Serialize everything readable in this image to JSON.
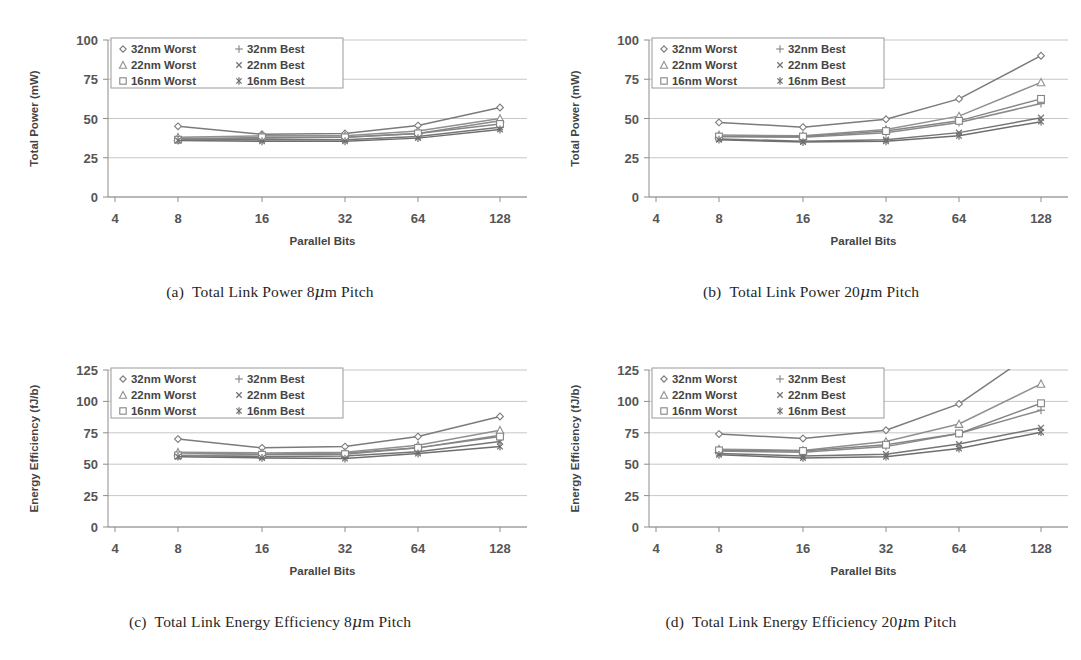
{
  "figure": {
    "panels": [
      "a",
      "b",
      "c",
      "d"
    ]
  },
  "captions": {
    "a": {
      "tag": "(a)",
      "text_before": "Total Link Power 8",
      "mu": "μ",
      "text_after": "m Pitch"
    },
    "b": {
      "tag": "(b)",
      "text_before": "Total Link Power 20",
      "mu": "μ",
      "text_after": "m Pitch"
    },
    "c": {
      "tag": "(c)",
      "text_before": "Total Link Energy Efficiency 8",
      "mu": "μ",
      "text_after": "m Pitch"
    },
    "d": {
      "tag": "(d)",
      "text_before": "Total Link Energy Efficiency 20",
      "mu": "μ",
      "text_after": "m Pitch"
    }
  },
  "legend": {
    "entries": [
      {
        "label": "32nm Worst",
        "marker": "diamond",
        "color": "#7b7b7b"
      },
      {
        "label": "32nm Best",
        "marker": "plus",
        "color": "#8a8a8a"
      },
      {
        "label": "22nm Worst",
        "marker": "triangle",
        "color": "#909090"
      },
      {
        "label": "22nm Best",
        "marker": "cross",
        "color": "#757575"
      },
      {
        "label": "16nm Worst",
        "marker": "square",
        "color": "#858585"
      },
      {
        "label": "16nm Best",
        "marker": "asterisk",
        "color": "#6e6e6e"
      }
    ],
    "order_display": [
      "32nm Worst",
      "32nm Best",
      "22nm Worst",
      "22nm Best",
      "16nm Worst",
      "16nm Best"
    ]
  },
  "chart_data": [
    {
      "id": "a",
      "type": "line",
      "title": "Total Link Power 8μm Pitch",
      "xlabel": "Parallel Bits",
      "ylabel": "Total Power (mW)",
      "categories": [
        "4",
        "8",
        "16",
        "32",
        "64",
        "128"
      ],
      "x": [
        4,
        8,
        16,
        32,
        64,
        128
      ],
      "xticklabels": [
        "4",
        "8",
        "16",
        "32",
        "64",
        "128"
      ],
      "yticklabels": [
        "0",
        "25",
        "50",
        "75",
        "100"
      ],
      "yticks": [
        0,
        25,
        50,
        75,
        100
      ],
      "ylim": [
        0,
        100
      ],
      "grid": true,
      "legend_position": "top-left",
      "series": [
        {
          "name": "32nm Worst",
          "marker": "diamond",
          "values": [
            null,
            45.0,
            40.0,
            40.5,
            45.5,
            57.0
          ]
        },
        {
          "name": "32nm Best",
          "marker": "plus",
          "values": [
            null,
            37.5,
            37.5,
            38.0,
            40.5,
            48.5
          ]
        },
        {
          "name": "22nm Worst",
          "marker": "triangle",
          "values": [
            null,
            38.0,
            39.0,
            39.0,
            42.0,
            50.0
          ]
        },
        {
          "name": "22nm Best",
          "marker": "cross",
          "values": [
            null,
            36.5,
            36.5,
            36.5,
            38.5,
            44.5
          ]
        },
        {
          "name": "16nm Worst",
          "marker": "square",
          "values": [
            null,
            36.5,
            38.0,
            38.0,
            40.5,
            46.5
          ]
        },
        {
          "name": "16nm Best",
          "marker": "asterisk",
          "values": [
            null,
            36.0,
            35.5,
            35.5,
            37.5,
            43.0
          ]
        }
      ]
    },
    {
      "id": "b",
      "type": "line",
      "title": "Total Link Power 20μm Pitch",
      "xlabel": "Parallel Bits",
      "ylabel": "Total Power (mW)",
      "categories": [
        "4",
        "8",
        "16",
        "32",
        "64",
        "128"
      ],
      "x": [
        4,
        8,
        16,
        32,
        64,
        128
      ],
      "xticklabels": [
        "4",
        "8",
        "16",
        "32",
        "64",
        "128"
      ],
      "yticklabels": [
        "0",
        "25",
        "50",
        "75",
        "100"
      ],
      "yticks": [
        0,
        25,
        50,
        75,
        100
      ],
      "ylim": [
        0,
        100
      ],
      "grid": true,
      "legend_position": "top-left",
      "series": [
        {
          "name": "32nm Worst",
          "marker": "diamond",
          "values": [
            null,
            47.5,
            44.5,
            49.5,
            62.5,
            90.0
          ]
        },
        {
          "name": "32nm Best",
          "marker": "plus",
          "values": [
            null,
            38.5,
            38.0,
            41.0,
            47.5,
            59.5
          ]
        },
        {
          "name": "22nm Worst",
          "marker": "triangle",
          "values": [
            null,
            39.5,
            39.0,
            43.0,
            51.5,
            73.0
          ]
        },
        {
          "name": "22nm Best",
          "marker": "cross",
          "values": [
            null,
            37.0,
            35.5,
            36.5,
            41.0,
            50.5
          ]
        },
        {
          "name": "16nm Worst",
          "marker": "square",
          "values": [
            null,
            38.5,
            38.5,
            42.0,
            48.5,
            62.5
          ]
        },
        {
          "name": "16nm Best",
          "marker": "asterisk",
          "values": [
            null,
            36.5,
            35.0,
            35.5,
            39.0,
            48.0
          ]
        }
      ]
    },
    {
      "id": "c",
      "type": "line",
      "title": "Total Link Energy Efficiency 8μm Pitch",
      "xlabel": "Parallel Bits",
      "ylabel": "Energy Efficiency (fJ/b)",
      "categories": [
        "4",
        "8",
        "16",
        "32",
        "64",
        "128"
      ],
      "x": [
        4,
        8,
        16,
        32,
        64,
        128
      ],
      "xticklabels": [
        "4",
        "8",
        "16",
        "32",
        "64",
        "128"
      ],
      "yticklabels": [
        "0",
        "25",
        "50",
        "75",
        "100",
        "125"
      ],
      "yticks": [
        0,
        25,
        50,
        75,
        100,
        125
      ],
      "ylim": [
        0,
        125
      ],
      "grid": true,
      "legend_position": "top-left",
      "series": [
        {
          "name": "32nm Worst",
          "marker": "diamond",
          "values": [
            null,
            70.0,
            63.0,
            64.0,
            72.0,
            88.0
          ]
        },
        {
          "name": "32nm Best",
          "marker": "plus",
          "values": [
            null,
            59.0,
            58.0,
            59.0,
            63.0,
            73.0
          ]
        },
        {
          "name": "22nm Worst",
          "marker": "triangle",
          "values": [
            null,
            59.5,
            59.0,
            59.5,
            65.0,
            77.0
          ]
        },
        {
          "name": "22nm Best",
          "marker": "cross",
          "values": [
            null,
            57.0,
            56.0,
            56.5,
            60.0,
            68.0
          ]
        },
        {
          "name": "16nm Worst",
          "marker": "square",
          "values": [
            null,
            57.0,
            57.5,
            58.0,
            63.0,
            72.0
          ]
        },
        {
          "name": "16nm Best",
          "marker": "asterisk",
          "values": [
            null,
            56.0,
            55.0,
            54.5,
            58.5,
            64.0
          ]
        }
      ]
    },
    {
      "id": "d",
      "type": "line",
      "title": "Total Link Energy Efficiency 20μm Pitch",
      "xlabel": "Parallel Bits",
      "ylabel": "Energy Efficiency (fJ/b)",
      "categories": [
        "4",
        "8",
        "16",
        "32",
        "64",
        "128"
      ],
      "x": [
        4,
        8,
        16,
        32,
        64,
        128
      ],
      "xticklabels": [
        "4",
        "8",
        "16",
        "32",
        "64",
        "128"
      ],
      "yticklabels": [
        "0",
        "25",
        "50",
        "75",
        "100",
        "125"
      ],
      "yticks": [
        0,
        25,
        50,
        75,
        100,
        125
      ],
      "ylim": [
        0,
        125
      ],
      "grid": true,
      "legend_position": "top-left",
      "note": "32nm Worst series exceeds the y-axis maximum at 128 bits and is clipped",
      "series": [
        {
          "name": "32nm Worst",
          "marker": "diamond",
          "values": [
            null,
            74.0,
            70.5,
            77.0,
            98.0,
            143.0
          ]
        },
        {
          "name": "32nm Best",
          "marker": "plus",
          "values": [
            null,
            60.5,
            59.5,
            64.0,
            74.5,
            93.0
          ]
        },
        {
          "name": "22nm Worst",
          "marker": "triangle",
          "values": [
            null,
            62.0,
            61.0,
            68.0,
            82.0,
            114.0
          ]
        },
        {
          "name": "22nm Best",
          "marker": "cross",
          "values": [
            null,
            58.5,
            56.5,
            58.0,
            66.0,
            79.0
          ]
        },
        {
          "name": "16nm Worst",
          "marker": "square",
          "values": [
            null,
            61.0,
            60.5,
            65.5,
            74.5,
            98.5
          ]
        },
        {
          "name": "16nm Best",
          "marker": "asterisk",
          "values": [
            null,
            57.5,
            55.0,
            56.0,
            62.5,
            75.5
          ]
        }
      ]
    }
  ]
}
